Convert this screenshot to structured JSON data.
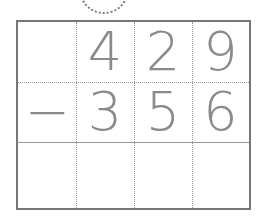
{
  "problem": {
    "operation": "subtraction",
    "row1": [
      "",
      "4",
      "2",
      "9"
    ],
    "row2": [
      "−",
      "3",
      "5",
      "6"
    ],
    "row3": [
      "",
      "",
      "",
      ""
    ]
  },
  "colors": {
    "digit": "#8a8a8a",
    "border": "#777777"
  }
}
